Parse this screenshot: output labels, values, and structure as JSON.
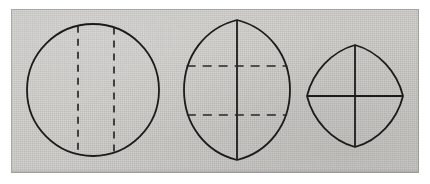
{
  "plate": {
    "title": "Three geometric lens and circle diagrams",
    "description": "Scanned line drawing plate showing three outlines with internal chord lines",
    "background_color": "#ffffff",
    "paper_color": "#cccac6",
    "ink_color": "#1c1b1a",
    "paper_area": {
      "x": 11,
      "y": 9,
      "width": 408,
      "height": 164
    }
  },
  "figures": [
    {
      "id": "figure-1",
      "name": "circle-with-two-vertical-dashed-chords",
      "shape": "circle",
      "center": {
        "x": 93,
        "y": 90
      },
      "radius": 66,
      "outline_style": "solid",
      "stroke_width": 1.7,
      "chords": [
        {
          "name": "left-dashed-chord",
          "orientation": "vertical",
          "x": 78,
          "style": "dashed"
        },
        {
          "name": "right-dashed-chord",
          "orientation": "vertical",
          "x": 114,
          "style": "dashed"
        }
      ]
    },
    {
      "id": "figure-2",
      "name": "vesica-with-vertical-axis-and-two-dashed-chords",
      "shape": "vesica-lens",
      "center": {
        "x": 237,
        "y": 90
      },
      "half_width": 53,
      "half_height": 70,
      "outline_style": "solid",
      "stroke_width": 1.7,
      "axes": [
        {
          "name": "vertical-axis",
          "orientation": "vertical",
          "style": "solid"
        }
      ],
      "chords": [
        {
          "name": "upper-dashed-chord",
          "orientation": "horizontal",
          "y": 66,
          "style": "dashed"
        },
        {
          "name": "lower-dashed-chord",
          "orientation": "horizontal",
          "y": 115,
          "style": "dashed"
        }
      ]
    },
    {
      "id": "figure-3",
      "name": "four-arc-oval-with-solid-cross-axes",
      "shape": "four-arc-pointed-oval",
      "center": {
        "x": 355,
        "y": 96
      },
      "half_width": 48,
      "half_height": 51,
      "outline_style": "solid",
      "stroke_width": 1.7,
      "axes": [
        {
          "name": "vertical-axis",
          "orientation": "vertical",
          "style": "solid"
        },
        {
          "name": "horizontal-axis",
          "orientation": "horizontal",
          "style": "solid"
        }
      ],
      "chords": []
    }
  ],
  "line_styles": {
    "dash_pattern": "7 6",
    "dash_pattern_fig2": "9 7"
  }
}
